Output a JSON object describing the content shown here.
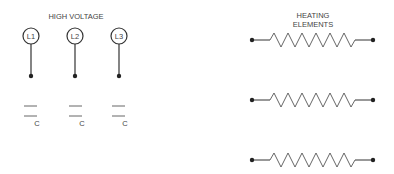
{
  "high_voltage": {
    "title": "HIGH VOLTAGE",
    "terminals": [
      {
        "label": "L1",
        "x": 31
      },
      {
        "label": "L2",
        "x": 75
      },
      {
        "label": "L3",
        "x": 119
      }
    ],
    "capacitors": [
      {
        "label": "C",
        "x": 31
      },
      {
        "label": "C",
        "x": 75
      },
      {
        "label": "C",
        "x": 119
      }
    ]
  },
  "heating": {
    "title_line1": "HEATING",
    "title_line2": "ELEMENTS",
    "elements": [
      {
        "y": 40
      },
      {
        "y": 100
      },
      {
        "y": 160
      }
    ]
  },
  "colors": {
    "line": "#333333",
    "text": "#444444",
    "dot": "#222222"
  }
}
